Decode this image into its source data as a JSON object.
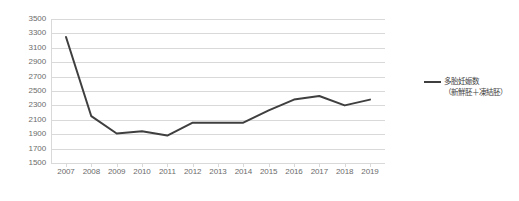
{
  "chart_data": {
    "type": "line",
    "title": "",
    "xlabel": "",
    "ylabel": "",
    "categories": [
      "2007",
      "2008",
      "2009",
      "2010",
      "2011",
      "2012",
      "2013",
      "2014",
      "2015",
      "2016",
      "2017",
      "2018",
      "2019"
    ],
    "values": [
      3250,
      2150,
      1910,
      1940,
      1880,
      2060,
      2060,
      2060,
      2230,
      2380,
      2430,
      2300,
      2380
    ],
    "series": [
      {
        "name": "多胎妊娠数（新鮮胚＋凍結胚）",
        "values": [
          3250,
          2150,
          1910,
          1940,
          1880,
          2060,
          2060,
          2060,
          2230,
          2380,
          2430,
          2300,
          2380
        ]
      }
    ],
    "ylim": [
      1500,
      3500
    ],
    "ytick_labels": [
      "3500",
      "3300",
      "3100",
      "2900",
      "2700",
      "2500",
      "2300",
      "2100",
      "1900",
      "1700",
      "1500"
    ],
    "ytick_values": [
      3500,
      3300,
      3100,
      2900,
      2700,
      2500,
      2300,
      2100,
      1900,
      1700,
      1500
    ],
    "grid": true,
    "legend_position": "right",
    "line_color": "#3f3f3f",
    "grid_color": "#d9d9d9",
    "tick_label_color": "#6b6b6b"
  },
  "legend": {
    "entries": [
      {
        "line1": "多胎妊娠数",
        "line2": "（新鮮胚＋凍結胚）"
      }
    ]
  }
}
